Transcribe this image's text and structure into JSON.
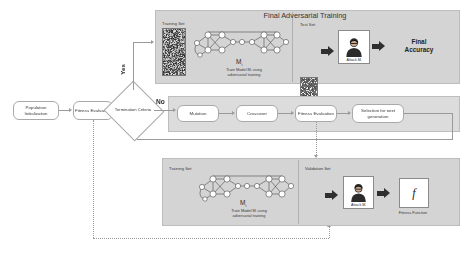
{
  "diagram": {
    "title": "Final Adversarial Training",
    "flow": {
      "population_init": "Population Initialization",
      "fitness_eval_left": "Fitness Evaluation",
      "termination": "Termination Criteria",
      "yes_label": "Yes",
      "no_label": "No",
      "mutation": "Mutation",
      "crossover": "Crossover",
      "fitness_eval_ga": "Fitness Evaluation",
      "selection": "Selection for next generation"
    },
    "top_panel": {
      "title": "Final Adversarial Training",
      "training_set_label": "Training Set",
      "model_label": "M",
      "model_sub": "i",
      "train_caption_line1": "Train Model Mᵢ using",
      "train_caption_line2": "adversarial training",
      "test_set_label": "Test Set",
      "attack_label": "Attack Mᵢ",
      "result_line1": "Final",
      "result_line2": "Accuracy"
    },
    "bottom_panel": {
      "training_set_label": "Training Set",
      "model_label": "M",
      "model_sub": "i",
      "train_caption_line1": "Train Model Mᵢ using",
      "train_caption_line2": "adversarial training",
      "validation_set_label": "Validation Set",
      "attack_label": "Attack Mᵢ",
      "fitness_symbol": "f",
      "fitness_caption": "Fitness Function"
    },
    "colors": {
      "panel_bg": "#d4d4d4",
      "arrow_dark": "#2f2f2f",
      "line_gray": "#9a9a9a",
      "box_border": "#a9a9a9",
      "speckle": "#8e8e8e"
    }
  }
}
